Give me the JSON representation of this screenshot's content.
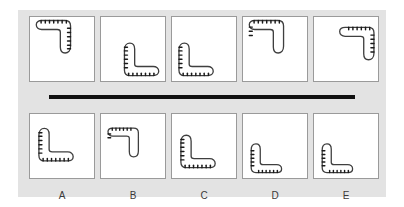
{
  "figure": {
    "type": "mental-rotation-test",
    "background_color": "#ffffff",
    "card_color": "#e3e3e3",
    "panel_fill": "#ffffff",
    "panel_border_color": "#9a9a9a",
    "divider_color": "#111111",
    "shape_outline_color": "#3f3f3f",
    "shape_tooth_color": "#1a1a1a",
    "label_color": "#3a3a3a"
  },
  "top_row": {
    "name": "stimulus-row",
    "panels": [
      {
        "id": "top-1",
        "shape": "serrated-boomerang",
        "rotation_deg": 0,
        "position": "top-left",
        "tooth_edge": "outer"
      },
      {
        "id": "top-2",
        "shape": "serrated-boomerang",
        "rotation_deg": 180,
        "position": "bottom-right",
        "tooth_edge": "outer"
      },
      {
        "id": "top-3",
        "shape": "serrated-boomerang",
        "rotation_deg": 180,
        "position": "bottom-left",
        "tooth_edge": "outer"
      },
      {
        "id": "top-4",
        "shape": "serrated-boomerang",
        "rotation_deg": 0,
        "position": "top-left",
        "tooth_edge": "outer"
      },
      {
        "id": "top-5",
        "shape": "serrated-boomerang",
        "rotation_deg": 0,
        "position": "top-right",
        "tooth_edge": "outer"
      }
    ]
  },
  "divider": {
    "name": "row-divider",
    "style": "thick-horizontal-rule"
  },
  "bottom_row": {
    "name": "answer-options-row",
    "panels": [
      {
        "id": "opt-A",
        "label": "A",
        "shape": "serrated-boomerang",
        "rotation_deg": 180,
        "position": "center-left",
        "tooth_edge": "outer"
      },
      {
        "id": "opt-B",
        "label": "B",
        "shape": "serrated-boomerang",
        "rotation_deg": 0,
        "position": "center-left",
        "tooth_edge": "outer"
      },
      {
        "id": "opt-C",
        "label": "C",
        "shape": "serrated-boomerang",
        "rotation_deg": 180,
        "position": "center-left",
        "tooth_edge": "outer"
      },
      {
        "id": "opt-D",
        "label": "D",
        "shape": "serrated-boomerang",
        "rotation_deg": 180,
        "position": "bottom-left",
        "tooth_edge": "outer"
      },
      {
        "id": "opt-E",
        "label": "E",
        "shape": "serrated-boomerang",
        "rotation_deg": 180,
        "position": "bottom-left",
        "tooth_edge": "outer"
      }
    ],
    "labels": [
      "A",
      "B",
      "C",
      "D",
      "E"
    ]
  }
}
